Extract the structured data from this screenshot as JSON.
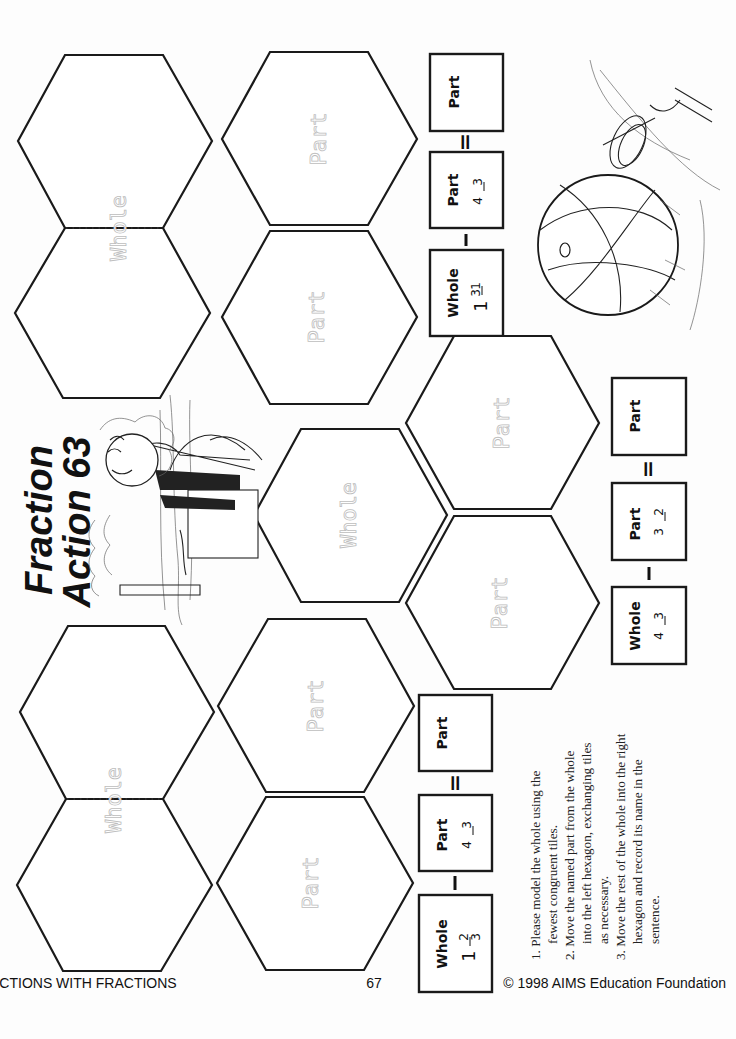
{
  "title": {
    "line1": "Fraction",
    "line2": "Action 63"
  },
  "labels": {
    "whole": "Whole",
    "part": "Part"
  },
  "operators": {
    "minus": "—",
    "equals": "="
  },
  "problems": [
    {
      "id": "problem-1",
      "whole": {
        "label": "Whole",
        "integer": "1",
        "numerator": "2",
        "denominator": "3"
      },
      "part": {
        "label": "Part",
        "numerator": "3",
        "denominator": "4"
      },
      "result": {
        "label": "Part",
        "value": ""
      }
    },
    {
      "id": "problem-2",
      "whole": {
        "label": "Whole",
        "integer": "",
        "numerator": "3",
        "denominator": "4"
      },
      "part": {
        "label": "Part",
        "numerator": "2",
        "denominator": "3"
      },
      "result": {
        "label": "Part",
        "value": ""
      }
    },
    {
      "id": "problem-3",
      "whole": {
        "label": "Whole",
        "integer": "1",
        "numerator": "1",
        "denominator": "3"
      },
      "part": {
        "label": "Part",
        "numerator": "3",
        "denominator": "4"
      },
      "result": {
        "label": "Part",
        "value": ""
      }
    }
  ],
  "instructions": [
    "1. Please model the whole using the",
    "fewest congruent tiles.",
    "2. Move the named part from the whole",
    "into the left hexagon, exchanging tiles",
    "as necessary.",
    "3. Move the rest of the whole into the right",
    "hexagon and record its name in the",
    "sentence."
  ],
  "footer": {
    "left": "ACTIONS WITH FRACTIONS",
    "center": "67",
    "right": "© 1998 AIMS Education Foundation"
  },
  "illustrations": {
    "top": "sunbather-on-towel-icon",
    "right": "beach-ball-and-pail-icon"
  },
  "colors": {
    "ink": "#1a1a1a",
    "ghost_text": "#bdbdbd",
    "paper": "#fdfdfd"
  }
}
